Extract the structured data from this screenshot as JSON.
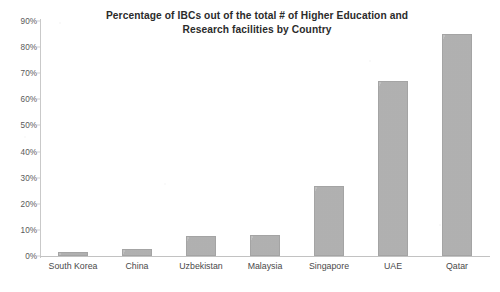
{
  "chart_data": {
    "type": "bar",
    "title": "Percentage of IBCs out of the total # of Higher Education and Research facilities by Country",
    "title_lines": [
      "Percentage of IBCs out of the total # of Higher Education and",
      "Research facilities by Country"
    ],
    "categories": [
      "South Korea",
      "China",
      "Uzbekistan",
      "Malaysia",
      "Singapore",
      "UAE",
      "Qatar"
    ],
    "values": [
      1.5,
      2.5,
      7.5,
      8,
      27,
      67,
      85
    ],
    "value_labels": [
      "1.5%",
      "2.5%",
      "7.5%",
      "8%",
      "27%",
      "67%",
      "85%"
    ],
    "xlabel": "",
    "ylabel": "",
    "ylim": [
      0,
      90
    ],
    "ytick_values": [
      0,
      10,
      20,
      30,
      40,
      50,
      60,
      70,
      80,
      90
    ],
    "ytick_labels": [
      "0%",
      "10%",
      "20%",
      "30%",
      "40%",
      "50%",
      "60%",
      "70%",
      "80%",
      "90%"
    ],
    "grid": false,
    "legend": false,
    "series": [
      {
        "name": "Percentage of IBCs",
        "values": [
          1.5,
          2.5,
          7.5,
          8,
          27,
          67,
          85
        ]
      }
    ],
    "colors": {
      "bar_fill": "#b3b3b3",
      "bar_border": "#a4a4a4",
      "axis": "#c5c5c5",
      "text": "#3a3a3a",
      "background": "#ffffff"
    }
  }
}
